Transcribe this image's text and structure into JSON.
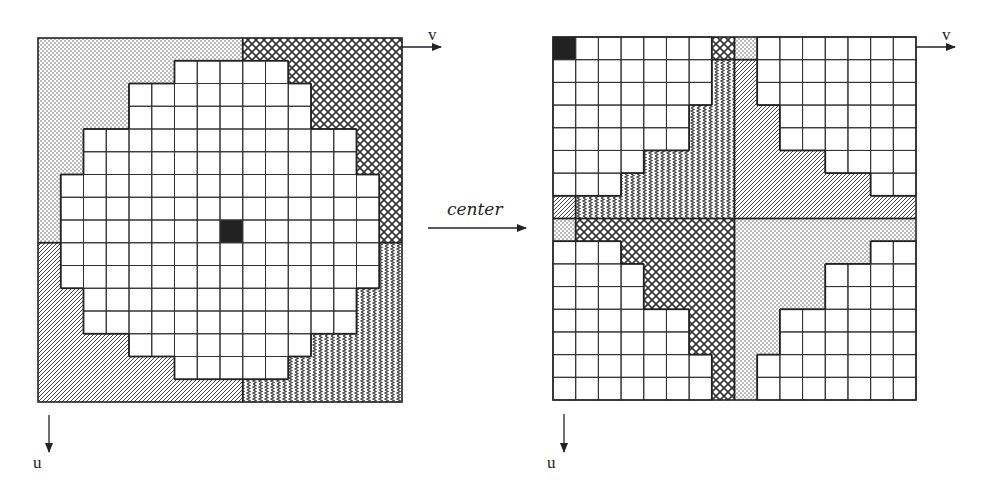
{
  "figure": {
    "arrow_label": "center",
    "axis_labels": {
      "horizontal": "v",
      "vertical": "u"
    },
    "grid_size": 16,
    "colors": {
      "line": "#333333",
      "fill_pattern": "#555555",
      "marked_cell": "#222222",
      "background": "#ffffff"
    },
    "patterns": [
      "dotted",
      "crosshatch",
      "diagonal",
      "wavy"
    ],
    "quadrants": {
      "top_left": "dotted",
      "top_right": "crosshatch",
      "bottom_left": "diagonal",
      "bottom_right": "wavy"
    },
    "disk_rows": [
      null,
      [
        6,
        10
      ],
      [
        4,
        11
      ],
      [
        4,
        11
      ],
      [
        2,
        13
      ],
      [
        2,
        13
      ],
      [
        1,
        14
      ],
      [
        1,
        14
      ],
      [
        1,
        14
      ],
      [
        1,
        14
      ],
      [
        1,
        14
      ],
      [
        2,
        13
      ],
      [
        2,
        13
      ],
      [
        4,
        11
      ],
      [
        6,
        10
      ],
      null
    ],
    "marked_cell": {
      "row": 8,
      "col": 8
    },
    "panels": [
      {
        "name": "original",
        "x": 38,
        "y": 38,
        "size": 364,
        "shift": 0
      },
      {
        "name": "centered",
        "x": 553,
        "y": 37,
        "size": 363,
        "shift": 8
      }
    ]
  }
}
